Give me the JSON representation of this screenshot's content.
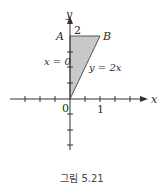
{
  "figure": {
    "caption": "그림 5.21",
    "axis_labels": {
      "x": "x",
      "y": "y"
    },
    "tick_labels": {
      "origin": "0",
      "x1": "1",
      "y2": "2"
    },
    "points": {
      "A": "A",
      "B": "B"
    },
    "curve_labels": {
      "left_edge": "x = 0",
      "right_edge": "y = 2x"
    },
    "colors": {
      "region_fill": "#c8c8c8",
      "axis": "#333333"
    }
  }
}
